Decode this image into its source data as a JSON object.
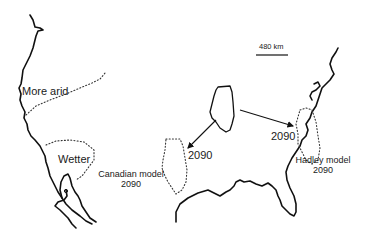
{
  "map": {
    "title": "Projected shift of Illinois climate by 2090",
    "scale_bar": {
      "label": "480 km"
    },
    "regions": {
      "arid": {
        "label": "More arid"
      },
      "wet": {
        "label": "Wetter"
      }
    },
    "projections": [
      {
        "model": "Canadian model",
        "year": "2090",
        "arrow_label": "2090"
      },
      {
        "model": "Hadley model",
        "year": "2090",
        "arrow_label": "2090"
      }
    ],
    "colors": {
      "line": "#111111",
      "background": "#ffffff"
    }
  }
}
